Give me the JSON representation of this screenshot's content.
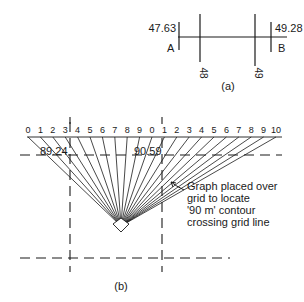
{
  "part_a": {
    "caption": "(a)",
    "point_a": {
      "label": "A",
      "value": "47.63"
    },
    "point_b": {
      "label": "B",
      "value": "49.28"
    },
    "grid_lines": [
      "48",
      "49"
    ]
  },
  "part_b": {
    "caption": "(b)",
    "scale_labels": [
      "0",
      "1",
      "2",
      "3",
      "4",
      "5",
      "6",
      "7",
      "8",
      "9",
      "0",
      "1",
      "2",
      "3",
      "4",
      "5",
      "6",
      "7",
      "8",
      "9",
      "10"
    ],
    "scale_markers": [
      "4|5",
      "4|5"
    ],
    "value_left": "89.24",
    "value_right": "90.59",
    "annotation": {
      "line1": "Graph placed over",
      "line2": "grid to locate",
      "line3": "'90 m' contour",
      "line4": "crossing grid line"
    }
  },
  "colors": {
    "ink": "#1a1a1a",
    "background": "#ffffff"
  }
}
